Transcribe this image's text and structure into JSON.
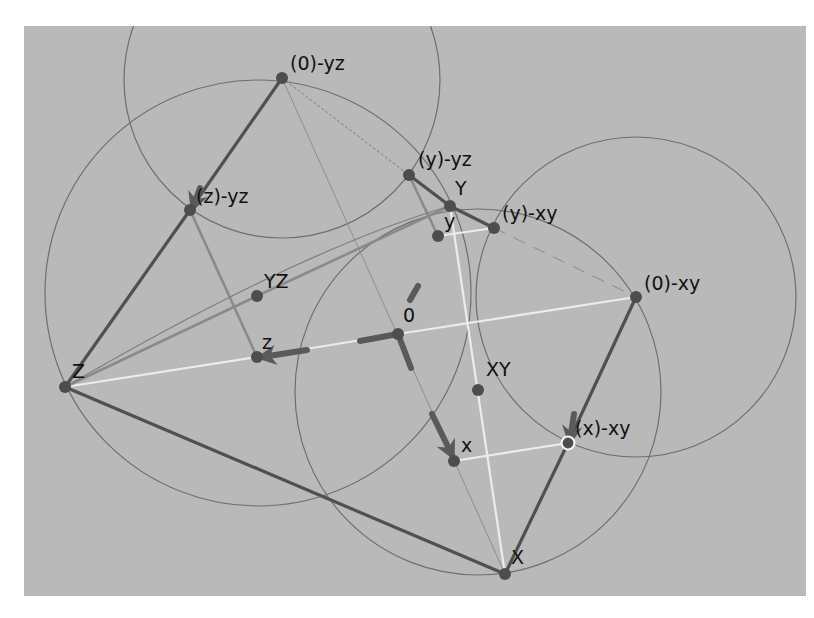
{
  "canvas": {
    "background": "#b9b9b9",
    "origin_offset": [
      24,
      26
    ],
    "size": [
      782,
      570
    ]
  },
  "colors": {
    "circle": "#6f6f6f",
    "dark_edge": "#505050",
    "mid_edge": "#8a8a8a",
    "white_edge": "#ececec",
    "point": "#4d4d4d",
    "arrow": "#5a5a5a",
    "label": "#111111"
  },
  "points": [
    {
      "id": "p0yz",
      "label": "(0)-yz",
      "x": 282,
      "y": 78,
      "lx": 290,
      "ly": 70
    },
    {
      "id": "pzyz",
      "label": "(z)-yz",
      "x": 190,
      "y": 210,
      "lx": 196,
      "ly": 203
    },
    {
      "id": "pZ",
      "label": "Z",
      "x": 65,
      "y": 387,
      "lx": 72,
      "ly": 378
    },
    {
      "id": "pYZ",
      "label": "YZ",
      "x": 257,
      "y": 296,
      "lx": 264,
      "ly": 288
    },
    {
      "id": "pz",
      "label": "z",
      "x": 257,
      "y": 357,
      "lx": 262,
      "ly": 349
    },
    {
      "id": "p0",
      "label": "0",
      "x": 398,
      "y": 334,
      "lx": 403,
      "ly": 322
    },
    {
      "id": "pyyz",
      "label": "(y)-yz",
      "x": 409,
      "y": 175,
      "lx": 418,
      "ly": 166
    },
    {
      "id": "pY",
      "label": "Y",
      "x": 450,
      "y": 206,
      "lx": 455,
      "ly": 195
    },
    {
      "id": "py",
      "label": "y",
      "x": 438,
      "y": 236,
      "lx": 444,
      "ly": 228
    },
    {
      "id": "pyxy",
      "label": "(y)-xy",
      "x": 494,
      "y": 228,
      "lx": 502,
      "ly": 220
    },
    {
      "id": "p0xy",
      "label": "(0)-xy",
      "x": 636,
      "y": 297,
      "lx": 644,
      "ly": 290
    },
    {
      "id": "pXY",
      "label": "XY",
      "x": 478,
      "y": 390,
      "lx": 486,
      "ly": 376
    },
    {
      "id": "px",
      "label": "x",
      "x": 454,
      "y": 461,
      "lx": 461,
      "ly": 452
    },
    {
      "id": "pxxy",
      "label": "(x)-xy",
      "x": 568,
      "y": 443,
      "lx": 575,
      "ly": 435,
      "selected": true
    },
    {
      "id": "pX",
      "label": "X",
      "x": 505,
      "y": 574,
      "lx": 511,
      "ly": 564
    }
  ],
  "circles": [
    {
      "name": "circle-top",
      "cx": 282,
      "cy": 80,
      "r": 158
    },
    {
      "name": "circle-left",
      "cx": 258,
      "cy": 293,
      "r": 213
    },
    {
      "name": "circle-lower-middle",
      "cx": 478,
      "cy": 392,
      "r": 183
    },
    {
      "name": "circle-right",
      "cx": 636,
      "cy": 297,
      "r": 160
    }
  ],
  "edges": [
    {
      "name": "edge-0yz-zyz",
      "from": "p0yz",
      "to": "pzyz",
      "style": "dark"
    },
    {
      "name": "edge-zyz-Z",
      "from": "pzyz",
      "to": "pZ",
      "style": "dark"
    },
    {
      "name": "edge-Z-X",
      "from": "pZ",
      "to": "pX",
      "style": "dark"
    },
    {
      "name": "edge-X-xxy",
      "from": "pX",
      "to": "pxxy",
      "style": "dark"
    },
    {
      "name": "edge-xxy-0xy",
      "from": "pxxy",
      "to": "p0xy",
      "style": "dark"
    },
    {
      "name": "edge-yyz-Y",
      "from": "pyyz",
      "to": "pY",
      "style": "dark"
    },
    {
      "name": "edge-Y-yxy",
      "from": "pY",
      "to": "pyxy",
      "style": "dark"
    },
    {
      "name": "edge-zyz-z",
      "from": "pzyz",
      "to": "pz",
      "style": "mid"
    },
    {
      "name": "edge-yyz-y",
      "from": "pyyz",
      "to": "py",
      "style": "mid"
    },
    {
      "name": "edge-Z-YZ",
      "from": "pZ",
      "to": "pYZ",
      "style": "mid"
    },
    {
      "name": "edge-YZ-Y",
      "from": "pYZ",
      "to": "pY",
      "style": "mid"
    },
    {
      "name": "edge-Z-z",
      "from": "pZ",
      "to": "pz",
      "style": "white"
    },
    {
      "name": "edge-z-0",
      "from": "pz",
      "to": "p0",
      "style": "white"
    },
    {
      "name": "edge-0-0xy",
      "from": "p0",
      "to": "p0xy",
      "style": "white"
    },
    {
      "name": "edge-Y-X",
      "from": "pY",
      "to": "pX",
      "style": "white"
    },
    {
      "name": "edge-y-yxy",
      "from": "py",
      "to": "pyxy",
      "style": "white"
    },
    {
      "name": "edge-x-xxy",
      "from": "px",
      "to": "pxxy",
      "style": "white"
    },
    {
      "name": "edge-0yz-X",
      "from": "p0yz",
      "to": "pX",
      "style": "thin"
    },
    {
      "name": "edge-0yz-yyz",
      "from": "p0yz",
      "to": "pyyz",
      "style": "dotted"
    },
    {
      "name": "edge-yxy-0xy",
      "from": "pyxy",
      "to": "p0xy",
      "style": "dashed"
    }
  ],
  "axes": {
    "origin": [
      398,
      334
    ],
    "segments": [
      {
        "name": "axis-z-stub",
        "x1": 398,
        "y1": 334,
        "x2": 360,
        "y2": 341
      },
      {
        "name": "axis-x-stub",
        "x1": 398,
        "y1": 334,
        "x2": 411,
        "y2": 368
      },
      {
        "name": "axis-y-stub",
        "x1": 418,
        "y1": 286,
        "x2": 410,
        "y2": 300
      }
    ],
    "arrows": [
      {
        "name": "arrow-z",
        "x1": 307,
        "y1": 350,
        "x2": 262,
        "y2": 357
      },
      {
        "name": "arrow-x",
        "x1": 432,
        "y1": 414,
        "x2": 452,
        "y2": 455
      },
      {
        "name": "arrow-xxy",
        "x1": 574,
        "y1": 414,
        "x2": 570,
        "y2": 440
      },
      {
        "name": "arrow-zyz",
        "x1": 200,
        "y1": 188,
        "x2": 193,
        "y2": 207
      }
    ]
  }
}
